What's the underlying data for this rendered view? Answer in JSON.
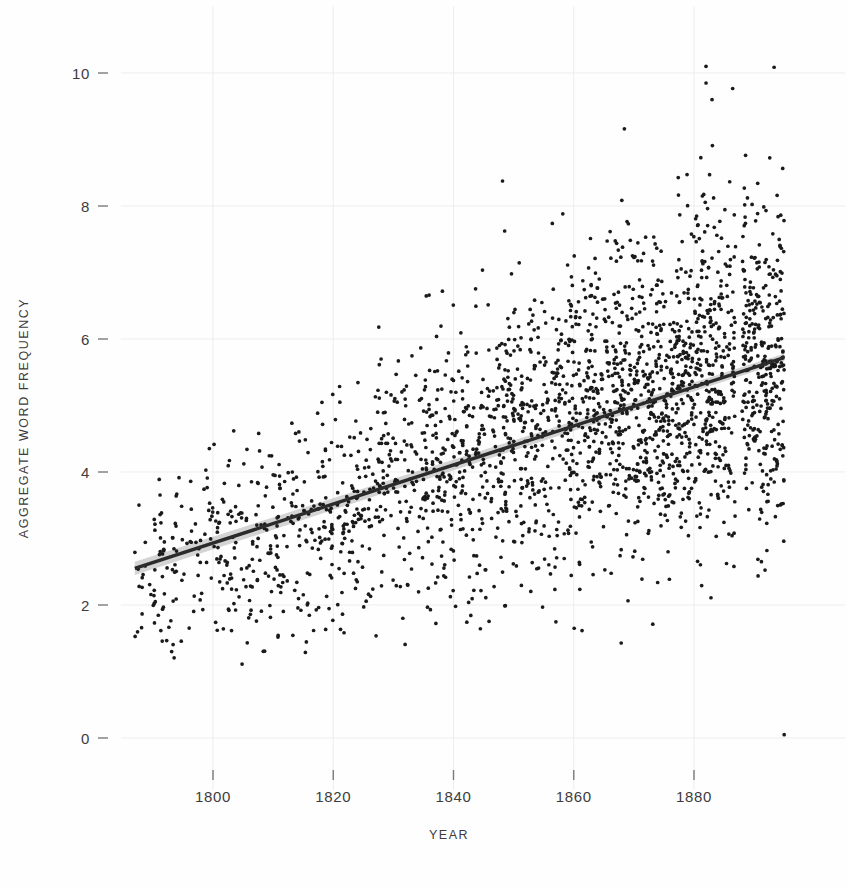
{
  "chart_data": {
    "type": "scatter",
    "title": "",
    "subtitle": "",
    "xlabel": "YEAR",
    "ylabel": "AGGREGATE WORD FREQUENCY",
    "xlim": [
      1786,
      1896
    ],
    "ylim": [
      -0.45,
      10.55
    ],
    "xticks": [
      1800,
      1820,
      1840,
      1860,
      1880
    ],
    "xtick_labels": [
      "1800",
      "1820",
      "1840",
      "1860",
      "1880"
    ],
    "yticks": [
      0,
      2,
      4,
      6,
      8,
      10
    ],
    "ytick_labels": [
      "0",
      "2",
      "4",
      "6",
      "8",
      "10"
    ],
    "grid": true,
    "grid_color": "#ededed",
    "legend": "none",
    "point_color": "#1a1a1a",
    "point_size": 2.6,
    "n_points": 2200,
    "series": [
      {
        "name": "Aggregate word frequency by year",
        "description": "Scatter of per-text aggregate word frequency against publication year, 1787-1895; spread widens and mean rises over time."
      }
    ],
    "trendline": {
      "type": "linear_fit",
      "color": "#2b2b2b",
      "width": 3.4,
      "x_start": 1787,
      "x_end": 1895,
      "y_start": 2.55,
      "y_end": 5.72,
      "slope_per_year": 0.02935,
      "confidence_band": true,
      "band_color": "#b0b0b0",
      "band_half_width_start": 0.1,
      "band_half_width_end": 0.06
    },
    "density_by_decade": [
      {
        "decade": 1790,
        "count": 70,
        "mean": 2.72,
        "sd": 0.62
      },
      {
        "decade": 1800,
        "count": 95,
        "mean": 2.95,
        "sd": 0.66
      },
      {
        "decade": 1810,
        "count": 110,
        "mean": 3.18,
        "sd": 0.7
      },
      {
        "decade": 1820,
        "count": 140,
        "mean": 3.52,
        "sd": 0.8
      },
      {
        "decade": 1830,
        "count": 170,
        "mean": 3.88,
        "sd": 0.88
      },
      {
        "decade": 1840,
        "count": 215,
        "mean": 4.22,
        "sd": 0.98
      },
      {
        "decade": 1850,
        "count": 265,
        "mean": 4.55,
        "sd": 1.05
      },
      {
        "decade": 1860,
        "count": 320,
        "mean": 4.85,
        "sd": 1.12
      },
      {
        "decade": 1870,
        "count": 390,
        "mean": 5.15,
        "sd": 1.18
      },
      {
        "decade": 1880,
        "count": 425,
        "mean": 5.45,
        "sd": 1.22
      }
    ],
    "notable_outliers": [
      {
        "x": 1882,
        "y": 10.1
      },
      {
        "x": 1882,
        "y": 9.85
      },
      {
        "x": 1883,
        "y": 9.6
      },
      {
        "x": 1895,
        "y": 0.05
      }
    ]
  },
  "axes": {
    "y_title": "AGGREGATE WORD FREQUENCY",
    "x_title": "YEAR"
  }
}
